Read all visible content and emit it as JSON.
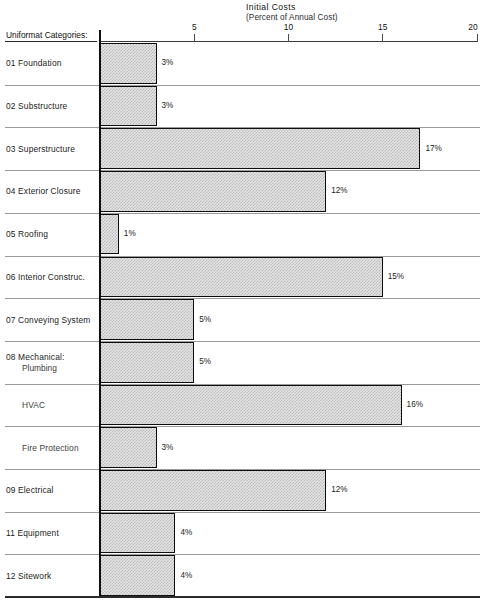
{
  "header": {
    "title": "Initial  Costs",
    "subtitle": "(Percent of Annual Cost)",
    "categories_heading": "Uniformat Categories:"
  },
  "axis": {
    "ticks": [
      {
        "label": "5",
        "value": 5
      },
      {
        "label": "10",
        "value": 10
      },
      {
        "label": "15",
        "value": 15
      },
      {
        "label": "20",
        "value": 20
      }
    ],
    "min": 0,
    "max": 20
  },
  "chart_data": {
    "type": "bar",
    "orientation": "horizontal",
    "title": "Initial  Costs",
    "subtitle": "(Percent of Annual Cost)",
    "xlabel": "(Percent of Annual Cost)",
    "ylabel": "Uniformat Categories:",
    "xlim": [
      0,
      20
    ],
    "xticks": [
      5,
      10,
      15,
      20
    ],
    "grid": false,
    "legend": null,
    "value_suffix": "%",
    "categories": [
      "01  Foundation",
      "02  Substructure",
      "03  Superstructure",
      "04  Exterior Closure",
      "05  Roofing",
      "06  Interior Construc.",
      "07  Conveying System",
      "08  Mechanical:",
      "HVAC",
      "Fire Protection",
      "09  Electrical",
      "11  Equipment",
      "12  Sitework"
    ],
    "values": [
      3,
      3,
      17,
      12,
      1,
      15,
      5,
      5,
      16,
      3,
      12,
      4,
      4
    ],
    "value_labels": [
      "3%",
      "3%",
      "17%",
      "12%",
      "1%",
      "15%",
      "5%",
      "5%",
      "16%",
      "3%",
      "12%",
      "4%",
      "4%"
    ]
  },
  "rows": [
    {
      "label": "01  Foundation",
      "label2": null,
      "sub": false,
      "value": 3,
      "value_label": "3%"
    },
    {
      "label": "02  Substructure",
      "label2": null,
      "sub": false,
      "value": 3,
      "value_label": "3%"
    },
    {
      "label": "03  Superstructure",
      "label2": null,
      "sub": false,
      "value": 17,
      "value_label": "17%"
    },
    {
      "label": "04  Exterior Closure",
      "label2": null,
      "sub": false,
      "value": 12,
      "value_label": "12%"
    },
    {
      "label": "05  Roofing",
      "label2": null,
      "sub": false,
      "value": 1,
      "value_label": "1%"
    },
    {
      "label": "06  Interior Construc.",
      "label2": null,
      "sub": false,
      "value": 15,
      "value_label": "15%"
    },
    {
      "label": "07  Conveying System",
      "label2": null,
      "sub": false,
      "value": 5,
      "value_label": "5%"
    },
    {
      "label": "08  Mechanical:",
      "label2": "Plumbing",
      "sub": false,
      "value": 5,
      "value_label": "5%"
    },
    {
      "label": "HVAC",
      "label2": null,
      "sub": true,
      "value": 16,
      "value_label": "16%"
    },
    {
      "label": "Fire Protection",
      "label2": null,
      "sub": true,
      "value": 3,
      "value_label": "3%"
    },
    {
      "label": "09  Electrical",
      "label2": null,
      "sub": false,
      "value": 12,
      "value_label": "12%"
    },
    {
      "label": "11  Equipment",
      "label2": null,
      "sub": false,
      "value": 4,
      "value_label": "4%"
    },
    {
      "label": "12  Sitework",
      "label2": null,
      "sub": false,
      "value": 4,
      "value_label": "4%"
    }
  ],
  "colors": {
    "bar_fill": "#e6e6e6",
    "bar_pattern": "#b9b9b9",
    "bar_border": "#0d0d0d",
    "separator": "#9a9a9a",
    "axis": "#3a3a3a",
    "text": "#1b1b1b",
    "background": "#ffffff"
  },
  "geometry": {
    "axis_x0": 100,
    "px_per_unit": 18.85,
    "plot_top": 42,
    "row_height": 42.7,
    "baseline_y": 596
  }
}
